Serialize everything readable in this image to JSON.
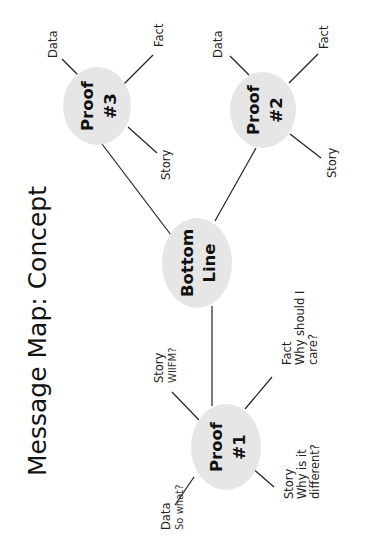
{
  "title": "Message Map: Concept",
  "orientation": "rotated -90deg",
  "colors": {
    "node_fill": "#e6e6e6",
    "line": "#222222",
    "text": "#111111",
    "background": "#ffffff"
  },
  "center_node": {
    "line1": "Bottom",
    "line2": "Line"
  },
  "proofs": [
    {
      "id": "proof-1",
      "line1": "Proof",
      "line2": "#1",
      "leaves": [
        {
          "id": "data",
          "label": "Data",
          "sub": "So what?"
        },
        {
          "id": "story-wiifm",
          "label": "Story",
          "sub": "WIIFM?"
        },
        {
          "id": "fact",
          "label": "Fact",
          "sub1": "Why should I",
          "sub2": "care?"
        },
        {
          "id": "story-different",
          "label": "Story",
          "sub1": "Why is it",
          "sub2": "different?"
        }
      ]
    },
    {
      "id": "proof-2",
      "line1": "Proof",
      "line2": "#2",
      "leaves": [
        {
          "id": "data",
          "label": "Data"
        },
        {
          "id": "fact",
          "label": "Fact"
        },
        {
          "id": "story",
          "label": "Story"
        }
      ]
    },
    {
      "id": "proof-3",
      "line1": "Proof",
      "line2": "#3",
      "leaves": [
        {
          "id": "data",
          "label": "Data"
        },
        {
          "id": "fact",
          "label": "Fact"
        },
        {
          "id": "story",
          "label": "Story"
        }
      ]
    }
  ]
}
